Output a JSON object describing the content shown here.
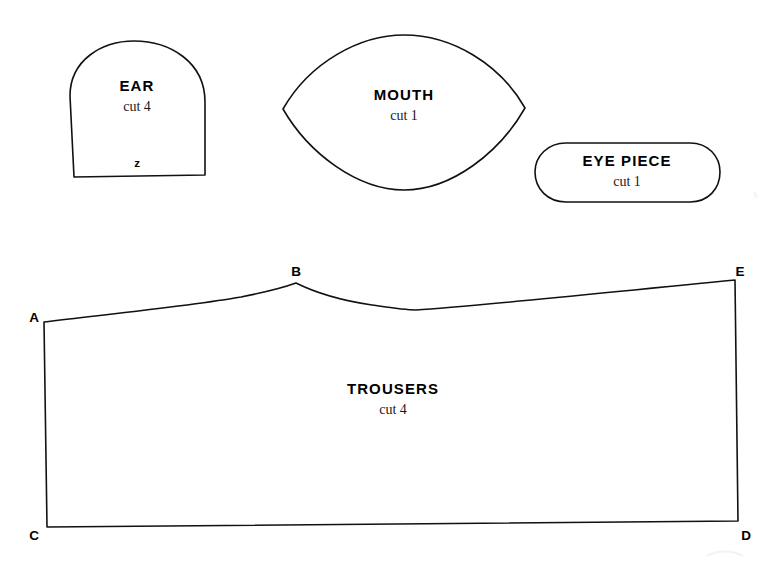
{
  "sheet": {
    "background_color": "#ffffff",
    "ink_color": "#111111",
    "width": 775,
    "height": 569
  },
  "pieces": [
    {
      "id": "ear",
      "title": "EAR",
      "quantity": "cut 4",
      "notch": "z",
      "shape": "dome"
    },
    {
      "id": "mouth",
      "title": "MOUTH",
      "quantity": "cut 1",
      "shape": "lens"
    },
    {
      "id": "eye-piece",
      "title": "EYE PIECE",
      "quantity": "cut 1",
      "shape": "stadium"
    },
    {
      "id": "trousers",
      "title": "TROUSERS",
      "quantity": "cut 4",
      "shape": "curved-quadrilateral"
    }
  ],
  "trousers_points": [
    {
      "id": "A",
      "label": "A"
    },
    {
      "id": "B",
      "label": "B"
    },
    {
      "id": "C",
      "label": "C"
    },
    {
      "id": "D",
      "label": "D"
    },
    {
      "id": "E",
      "label": "E"
    }
  ]
}
